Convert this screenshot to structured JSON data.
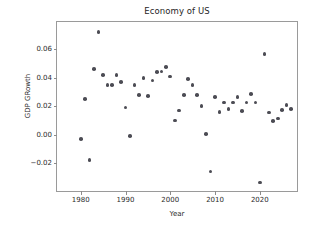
{
  "chart_data": {
    "type": "scatter",
    "title": "Economy of US",
    "xlabel": "Year",
    "ylabel": "GDP GRowth",
    "xlim": [
      1974.7,
      2028.3
    ],
    "ylim": [
      -0.0396,
      0.0792
    ],
    "xticks": [
      1980,
      1990,
      2000,
      2010,
      2020
    ],
    "xticklabels": [
      "1980",
      "1990",
      "2000",
      "2010",
      "2020"
    ],
    "yticks": [
      -0.02,
      0.0,
      0.02,
      0.04,
      0.06
    ],
    "yticklabels": [
      "−0.02",
      "0.00",
      "0.02",
      "0.04",
      "0.06"
    ],
    "grid": false,
    "legend": null,
    "marker": {
      "shape": "circle",
      "color": "#4c4c54",
      "size_px": 3.6
    },
    "series": [
      {
        "name": "GDP Growth",
        "x": [
          1980,
          1981,
          1982,
          1983,
          1984,
          1985,
          1986,
          1987,
          1988,
          1989,
          1990,
          1991,
          1992,
          1993,
          1994,
          1995,
          1996,
          1997,
          1998,
          1999,
          2000,
          2001,
          2002,
          2003,
          2004,
          2005,
          2006,
          2007,
          2008,
          2009,
          2010,
          2011,
          2012,
          2013,
          2014,
          2015,
          2016,
          2017,
          2018,
          2019,
          2020,
          2021,
          2022,
          2023,
          2024,
          2025,
          2026,
          2027
        ],
        "y": [
          -0.003,
          0.025,
          -0.018,
          0.046,
          0.072,
          0.042,
          0.035,
          0.035,
          0.042,
          0.037,
          0.019,
          -0.001,
          0.035,
          0.028,
          0.04,
          0.027,
          0.038,
          0.044,
          0.0445,
          0.0475,
          0.041,
          0.01,
          0.017,
          0.028,
          0.039,
          0.035,
          0.028,
          0.02,
          0.0005,
          -0.026,
          0.0265,
          0.016,
          0.0225,
          0.018,
          0.0225,
          0.0265,
          0.0165,
          0.0225,
          0.0285,
          0.0225,
          -0.0335,
          0.0565,
          0.0155,
          0.0095,
          0.0115,
          0.0175,
          0.021,
          0.018
        ]
      }
    ],
    "point_count": 48
  }
}
